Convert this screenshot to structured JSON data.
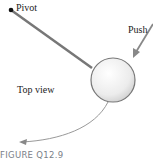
{
  "diagram": {
    "labels": {
      "pivot": "Pivot",
      "push": "Push",
      "view": "Top view"
    },
    "caption": "FIGURE Q12.9",
    "colors": {
      "rod": "#777777",
      "ball_fill": "#eeeeee",
      "ball_stroke": "#777777",
      "arrow": "#888888",
      "caption": "#7a8088"
    },
    "icons": {
      "pivot": "pivot-point-icon",
      "ball": "ball-icon",
      "push": "push-arrow-icon",
      "trajectory": "trajectory-arrow-icon"
    }
  }
}
